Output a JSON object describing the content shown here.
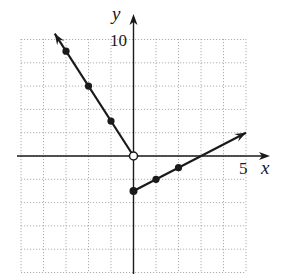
{
  "chart_data": {
    "type": "line",
    "title": "",
    "xlabel": "x",
    "ylabel": "y",
    "xlim": [
      -5,
      5
    ],
    "ylim": [
      -10,
      10
    ],
    "x_grid_step": 1,
    "y_grid_step": 2,
    "grid": true,
    "tick_labels": {
      "x": [
        "5"
      ],
      "y": [
        "10"
      ]
    },
    "series": [
      {
        "name": "left branch",
        "equation": "y = -3x, x < 0",
        "points": [
          [
            -3,
            9
          ],
          [
            -2,
            6
          ],
          [
            -1,
            3
          ]
        ],
        "endpoint": {
          "x": 0,
          "y": 0,
          "style": "open"
        },
        "arrow_to": [
          -3.5,
          10.5
        ]
      },
      {
        "name": "right branch",
        "equation": "y = x - 3, x >= 0",
        "points": [
          [
            0,
            -3
          ],
          [
            1,
            -2
          ],
          [
            2,
            -1
          ]
        ],
        "endpoint": {
          "x": 0,
          "y": -3,
          "style": "closed"
        },
        "arrow_to": [
          5,
          2
        ]
      }
    ],
    "colors": {
      "line": "#1a1a1a",
      "grid": "#9a9a9a",
      "axis": "#1a1a1a"
    }
  },
  "labels": {
    "x_axis": "x",
    "y_axis": "y",
    "x_tick": "5",
    "y_tick": "10"
  }
}
